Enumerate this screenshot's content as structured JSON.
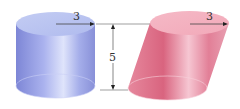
{
  "diagram": {
    "right_cylinder": {
      "radius_label": "3",
      "color": "#9aa6e6"
    },
    "oblique_cylinder": {
      "radius_label": "3",
      "color": "#e891a6"
    },
    "height_label": "5",
    "line_color": "#555555"
  }
}
